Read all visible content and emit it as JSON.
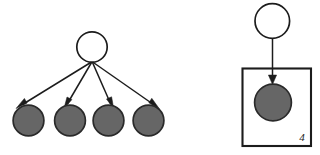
{
  "figure": {
    "background_color": "#ffffff",
    "width": 320,
    "height": 155
  },
  "style": {
    "node_open_fill": "#ffffff",
    "node_filled_fill": "#666666",
    "stroke_color": "#1c1c1c",
    "plate_stroke_color": "#1c1c1c"
  },
  "panels": [
    {
      "id": "expanded",
      "name": "expanded-form",
      "nodes": [
        {
          "id": "parent",
          "label": "",
          "shape": "circle",
          "state": "open",
          "cx": 92,
          "cy": 47,
          "r": 15.5
        },
        {
          "id": "child1",
          "label": "",
          "shape": "circle",
          "state": "filled",
          "cx": 28,
          "cy": 121,
          "r": 15.5
        },
        {
          "id": "child2",
          "label": "",
          "shape": "circle",
          "state": "filled",
          "cx": 70,
          "cy": 121,
          "r": 15.5
        },
        {
          "id": "child3",
          "label": "",
          "shape": "circle",
          "state": "filled",
          "cx": 108,
          "cy": 121,
          "r": 15.5
        },
        {
          "id": "child4",
          "label": "",
          "shape": "circle",
          "state": "filled",
          "cx": 148,
          "cy": 121,
          "r": 15.5
        }
      ],
      "edges": [
        {
          "from": "parent",
          "to": "child1",
          "directed": true
        },
        {
          "from": "parent",
          "to": "child2",
          "directed": true
        },
        {
          "from": "parent",
          "to": "child3",
          "directed": true
        },
        {
          "from": "parent",
          "to": "child4",
          "directed": true
        }
      ]
    },
    {
      "id": "plate",
      "name": "plate-form",
      "nodes": [
        {
          "id": "parent",
          "label": "",
          "shape": "circle",
          "state": "open",
          "cx": 272,
          "cy": 21,
          "r": 17.5
        },
        {
          "id": "repeated",
          "label": "",
          "shape": "circle",
          "state": "filled",
          "cx": 273,
          "cy": 102,
          "r": 18.5
        }
      ],
      "edges": [
        {
          "from": "parent",
          "to": "repeated",
          "directed": true
        }
      ],
      "plate": {
        "name": "repetition-plate",
        "label": "4",
        "x": 242,
        "y": 68,
        "width": 69,
        "height": 78,
        "label_x": 302,
        "label_y": 141
      }
    }
  ]
}
